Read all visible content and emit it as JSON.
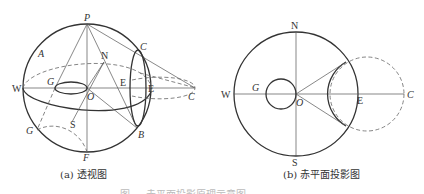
{
  "figure": {
    "panel_a": {
      "caption": "(a) 透视图",
      "labels": {
        "P": "P",
        "A": "A",
        "N": "N",
        "C_top": "C",
        "G_top": "G",
        "W": "W",
        "O": "O",
        "E_inner": "E",
        "E_outer": "E",
        "C_right": "C",
        "G_bottom": "G",
        "S": "S",
        "B": "B",
        "F": "F"
      }
    },
    "panel_b": {
      "caption": "(b) 赤平面投影图",
      "labels": {
        "N": "N",
        "W": "W",
        "G": "G",
        "O": "O",
        "E": "E",
        "C": "C",
        "S": "S"
      }
    },
    "figure_caption": "图 — 赤平面投影原理示意图"
  }
}
